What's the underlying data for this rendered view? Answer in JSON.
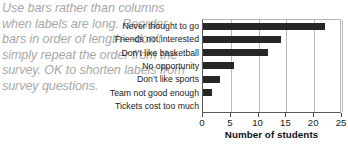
{
  "annotation": {
    "text": "Use bars rather than columns when labels are long. Reorder bars in order of length—don’t simply repeat the order from the survey. OK to shorten labels from survey questions."
  },
  "chart_data": {
    "type": "bar",
    "orientation": "horizontal",
    "title": "",
    "xlabel": "Number of students",
    "ylabel": "",
    "xlim": [
      0,
      25
    ],
    "ylim": null,
    "grid": true,
    "legend": null,
    "bar_color": "#272727",
    "categories": [
      "Never thought to go",
      "Friends not interested",
      "Don’t like basketball",
      "No opportunity",
      "Don’t like sports",
      "Team not good enough",
      "Tickets cost too much"
    ],
    "values": [
      22,
      14,
      11.7,
      5.5,
      3,
      1.7,
      0
    ],
    "xticks": [
      0,
      5,
      10,
      15,
      20,
      25
    ],
    "xtick_labels": [
      "0",
      "5",
      "10",
      "15",
      "20",
      "25"
    ]
  }
}
